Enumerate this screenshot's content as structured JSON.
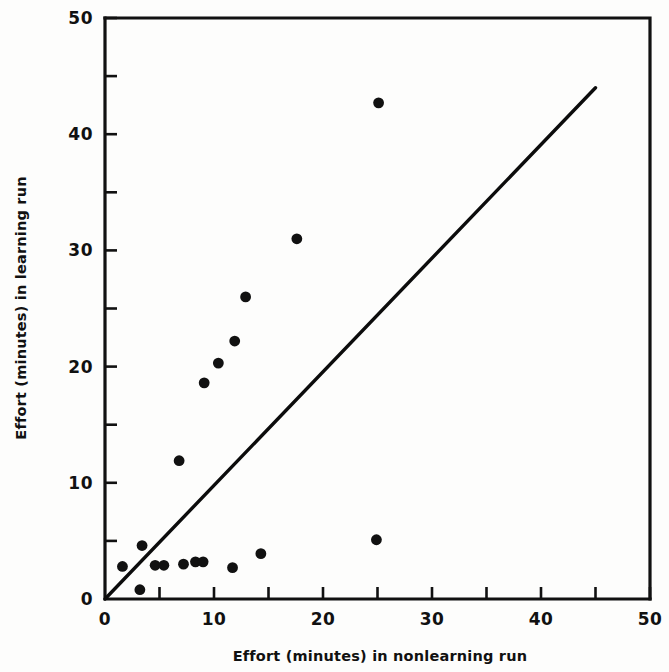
{
  "figure": {
    "background": "#fdfdfc",
    "ink_color": "#111111",
    "width": 669,
    "height": 672
  },
  "chart_data": {
    "type": "scatter",
    "title": "",
    "xlabel": "Effort (minutes) in nonlearning run",
    "ylabel": "Effort (minutes) in learning run",
    "xlim": [
      0,
      50
    ],
    "ylim": [
      0,
      50
    ],
    "grid": false,
    "legend": null,
    "x_major_ticks": [
      0,
      10,
      20,
      30,
      40,
      50
    ],
    "x_minor_ticks": [
      5,
      15,
      25,
      35,
      45
    ],
    "y_major_ticks": [
      0,
      10,
      20,
      30,
      40,
      50
    ],
    "y_minor_ticks": [
      5,
      15,
      25,
      35,
      45
    ],
    "x_tick_labels": [
      "0",
      "10",
      "20",
      "30",
      "40",
      "50"
    ],
    "y_tick_labels": [
      "0",
      "10",
      "20",
      "30",
      "40",
      "50"
    ],
    "series": [
      {
        "name": "observations",
        "marker": "filled-circle",
        "color": "#111111",
        "points": [
          [
            1.6,
            2.8
          ],
          [
            3.2,
            0.8
          ],
          [
            3.4,
            4.6
          ],
          [
            4.6,
            2.9
          ],
          [
            5.4,
            2.9
          ],
          [
            6.8,
            11.9
          ],
          [
            7.2,
            3.0
          ],
          [
            8.3,
            3.2
          ],
          [
            9.0,
            3.2
          ],
          [
            9.1,
            18.6
          ],
          [
            10.4,
            20.3
          ],
          [
            11.7,
            2.7
          ],
          [
            11.9,
            22.2
          ],
          [
            12.9,
            26.0
          ],
          [
            14.3,
            3.9
          ],
          [
            17.6,
            31.0
          ],
          [
            24.9,
            5.1
          ],
          [
            25.1,
            42.7
          ]
        ]
      }
    ],
    "reference_line": {
      "name": "equality-line",
      "description": "45 degree line y = x",
      "from": [
        0,
        0
      ],
      "to": [
        45,
        44
      ],
      "color": "#0c0c0c"
    }
  },
  "axis_titles": {
    "x": "Effort (minutes) in nonlearning run",
    "y": "Effort (minutes) in learning run"
  }
}
